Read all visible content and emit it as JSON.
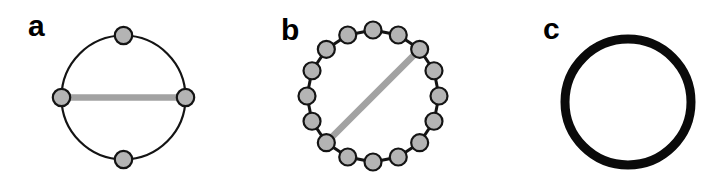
{
  "figure": {
    "background_color": "#ffffff",
    "width": 716,
    "height": 183,
    "colors": {
      "node_fill": "#b4b4b4",
      "node_stroke": "#141414",
      "ring_outline": "#141414",
      "bead_link": "#141414",
      "chord": "#a2a2a2",
      "thick_ring": "#0a0a0a",
      "label_color": "#000000"
    },
    "stroke_widths": {
      "ring_outline": 2.2,
      "node_stroke": 2.2,
      "bead_link": 3,
      "chord": 6.5,
      "thick_ring": 9
    },
    "panels": [
      {
        "label": "a",
        "type": "node-network",
        "ring_style": "outline",
        "center": {
          "x": 123.5,
          "y": 97.5
        },
        "radius": 62,
        "node_radius": 8.7,
        "node_count": 4,
        "node_angles_deg": [
          90,
          0,
          270,
          180
        ],
        "chord": {
          "from_deg": 180,
          "to_deg": 0
        }
      },
      {
        "label": "b",
        "type": "node-network",
        "ring_style": "beads",
        "center": {
          "x": 373,
          "y": 96
        },
        "radius": 66,
        "node_radius": 8.5,
        "node_count": 16,
        "node_angles_deg": [
          90,
          67.5,
          45,
          22.5,
          0,
          337.5,
          315,
          292.5,
          270,
          247.5,
          225,
          202.5,
          180,
          157.5,
          135,
          112.5
        ],
        "chord": {
          "from_deg": 225,
          "to_deg": 45
        }
      },
      {
        "label": "c",
        "type": "thick-ring",
        "center": {
          "x": 628,
          "y": 102
        },
        "radius": 63,
        "node_count": 0
      }
    ]
  }
}
